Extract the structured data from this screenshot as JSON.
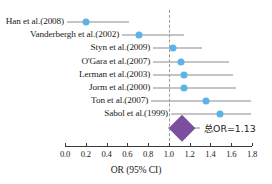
{
  "chart_data": {
    "type": "scatter",
    "plot_kind": "forest-plot",
    "title": "",
    "xlabel": "OR (95% CI)",
    "ylabel": "",
    "xlim": [
      0.0,
      1.8
    ],
    "xticks": [
      "0.0",
      "0.2",
      "0.4",
      "0.6",
      "0.8",
      "1.0",
      "1.2",
      "1.4",
      "1.6",
      "1.8"
    ],
    "xtick_values": [
      0.0,
      0.2,
      0.4,
      0.6,
      0.8,
      1.0,
      1.2,
      1.4,
      1.6,
      1.8
    ],
    "grid": false,
    "legend": "none",
    "reference_line": 1.0,
    "marker_color": "#5cb3e8",
    "ci_color": "#8c8c8c",
    "summary_color": "#7b4ea0",
    "studies": [
      {
        "label": "Han et al.(2008)",
        "or": 0.2,
        "ci_low": 0.02,
        "ci_high": 0.62
      },
      {
        "label": "Vanderbergh et al.(2002)",
        "or": 0.71,
        "ci_low": 0.55,
        "ci_high": 1.15
      },
      {
        "label": "Styn et al.(2009)",
        "or": 1.04,
        "ci_low": 0.85,
        "ci_high": 1.32
      },
      {
        "label": "O'Gara et al.(2007)",
        "or": 1.12,
        "ci_low": 0.85,
        "ci_high": 1.58
      },
      {
        "label": "Lerman et al.(2003)",
        "or": 1.15,
        "ci_low": 0.85,
        "ci_high": 1.62
      },
      {
        "label": "Jorm et al.(2000)",
        "or": 1.15,
        "ci_low": 0.85,
        "ci_high": 1.65
      },
      {
        "label": "Ton et al.(2007)",
        "or": 1.36,
        "ci_low": 0.83,
        "ci_high": 1.79
      },
      {
        "label": "Sabol et al.(1999)",
        "or": 1.49,
        "ci_low": 1.02,
        "ci_high": 1.79
      }
    ],
    "summary": {
      "label": "总OR=1.13",
      "or": 1.13,
      "ci_low": 1.01,
      "ci_high": 1.26,
      "line_low": 0.99,
      "line_high": 1.3
    }
  }
}
